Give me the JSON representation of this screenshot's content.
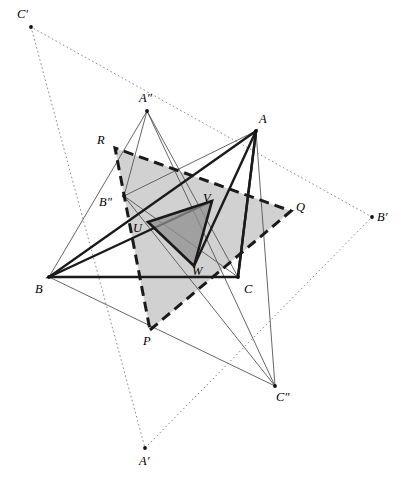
{
  "figure": {
    "width": 401,
    "height": 482,
    "background": "#ffffff"
  },
  "colors": {
    "stroke_dark": "#1a1a1a",
    "stroke_thin": "#555555",
    "stroke_dotted": "#8a8a8a",
    "fill_outer_triangle": "#bfbfbf",
    "fill_inner_triangle": "#9a9a9a",
    "label_color": "#000000",
    "dot_color": "#111111"
  },
  "points": [
    {
      "id": "A",
      "label": "A",
      "x": 256,
      "y": 131,
      "label_x": 259,
      "label_y": 113,
      "dot": true
    },
    {
      "id": "B",
      "label": "B",
      "x": 49,
      "y": 277,
      "label_x": 35,
      "label_y": 283,
      "dot": true
    },
    {
      "id": "C",
      "label": "C",
      "x": 238,
      "y": 277,
      "label_x": 244,
      "label_y": 283,
      "dot": true
    },
    {
      "id": "Ap",
      "label": "A′",
      "x": 145,
      "y": 448,
      "label_x": 139,
      "label_y": 455,
      "dot": true
    },
    {
      "id": "Bp",
      "label": "B′",
      "x": 372,
      "y": 217,
      "label_x": 377,
      "label_y": 211,
      "dot": true
    },
    {
      "id": "Cp",
      "label": "C′",
      "x": 31,
      "y": 27,
      "label_x": 17,
      "label_y": 8,
      "dot": true
    },
    {
      "id": "App",
      "label": "A″",
      "x": 147,
      "y": 111,
      "label_x": 139,
      "label_y": 92,
      "dot": true
    },
    {
      "id": "Bpp",
      "label": "B″",
      "x": 124,
      "y": 196,
      "label_x": 99,
      "label_y": 196,
      "dot": true
    },
    {
      "id": "Cpp",
      "label": "C″",
      "x": 275,
      "y": 386,
      "label_x": 276,
      "label_y": 391,
      "dot": true
    },
    {
      "id": "P",
      "label": "P",
      "x": 150,
      "y": 330,
      "label_x": 143,
      "label_y": 335,
      "dot": false
    },
    {
      "id": "Q",
      "label": "Q",
      "x": 291,
      "y": 211,
      "label_x": 296,
      "label_y": 201,
      "dot": false
    },
    {
      "id": "R",
      "label": "R",
      "x": 115,
      "y": 148,
      "label_x": 97,
      "label_y": 134,
      "dot": false
    },
    {
      "id": "U",
      "label": "U",
      "x": 148,
      "y": 222,
      "label_x": 133,
      "label_y": 222,
      "dot": false
    },
    {
      "id": "V",
      "label": "V",
      "x": 212,
      "y": 201,
      "label_x": 203,
      "label_y": 192,
      "dot": false
    },
    {
      "id": "W",
      "label": "W",
      "x": 194,
      "y": 266,
      "label_x": 192,
      "label_y": 265,
      "dot": false
    }
  ],
  "shapes": {
    "outer_filled_triangle": {
      "name": "triangle-PQR",
      "vertices": [
        "P",
        "Q",
        "R"
      ],
      "fill": "#bfbfbf",
      "fill_opacity": 0.72,
      "stroke": "#1a1a1a",
      "stroke_width": 3,
      "dash": "10,6"
    },
    "inner_filled_triangle": {
      "name": "triangle-UVW",
      "vertices": [
        "U",
        "V",
        "W"
      ],
      "fill": "#8f8f8f",
      "fill_opacity": 0.75,
      "stroke": "#1a1a1a",
      "stroke_width": 2.6,
      "dash": "none"
    },
    "main_triangle": {
      "name": "triangle-ABC",
      "vertices": [
        "A",
        "B",
        "C"
      ],
      "fill": "none",
      "stroke": "#1a1a1a",
      "stroke_width": 2.4,
      "dash": "none"
    },
    "dotted_triangle": {
      "name": "triangle-ApBpCp",
      "vertices": [
        "Ap",
        "Bp",
        "Cp"
      ],
      "fill": "none",
      "stroke": "#8a8a8a",
      "stroke_width": 1,
      "dash": "1.6,2.6"
    },
    "thin_triangle": {
      "name": "triangle-AppBppCpp",
      "vertices": [
        "App",
        "Bpp",
        "Cpp"
      ],
      "fill": "none",
      "stroke": "#555555",
      "stroke_width": 0.9,
      "dash": "none"
    }
  },
  "segments_thick": [
    {
      "name": "segment-B-V",
      "from": "B",
      "to": "V"
    },
    {
      "name": "segment-A-W",
      "from": "A",
      "to": "W"
    },
    {
      "name": "segment-A-C",
      "from": "A",
      "to": "C"
    }
  ],
  "segments_thin": [
    {
      "name": "segment-App-B",
      "from": "App",
      "to": "B"
    },
    {
      "name": "segment-App-C",
      "from": "App",
      "to": "C"
    },
    {
      "name": "segment-Bpp-A",
      "from": "Bpp",
      "to": "A"
    },
    {
      "name": "segment-Bpp-C",
      "from": "Bpp",
      "to": "C"
    },
    {
      "name": "segment-Cpp-A",
      "from": "Cpp",
      "to": "A"
    },
    {
      "name": "segment-Cpp-B",
      "from": "Cpp",
      "to": "B"
    }
  ],
  "legend_note": "Dotted outer triangle A'B'C'; thin triangle A''B''C''; dashed grey triangle PQR; solid dark triangle UVW inside main triangle ABC."
}
